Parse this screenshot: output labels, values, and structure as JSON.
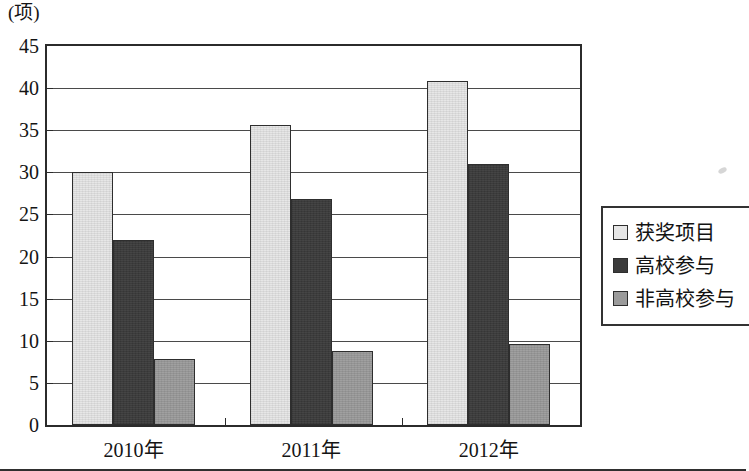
{
  "chart_data": {
    "type": "bar",
    "title": "",
    "subtitle": "",
    "unit_caption": "(项)",
    "xlabel": "",
    "ylabel": "",
    "categories": [
      "2010年",
      "2011年",
      "2012年"
    ],
    "series": [
      {
        "name": "获奖项目",
        "color": "#e6e6e6",
        "values": [
          30,
          35.6,
          40.8
        ]
      },
      {
        "name": "高校参与",
        "color": "#3b3b3b",
        "values": [
          22,
          26.8,
          31
        ]
      },
      {
        "name": "非高校参与",
        "color": "#9b9b9b",
        "values": [
          7.8,
          8.8,
          9.6
        ]
      }
    ],
    "ylim": [
      0,
      45
    ],
    "ytick_step": 5,
    "yticks": [
      "45",
      "40",
      "35",
      "30",
      "25",
      "20",
      "15",
      "10",
      "5",
      "0"
    ],
    "grid": true,
    "grid_axis": "y",
    "legend_position": "right",
    "orientation": "vertical",
    "grouping": "grouped"
  },
  "legend": {
    "items": [
      {
        "label": "获奖项目"
      },
      {
        "label": "高校参与"
      },
      {
        "label": "非高校参与"
      }
    ]
  }
}
